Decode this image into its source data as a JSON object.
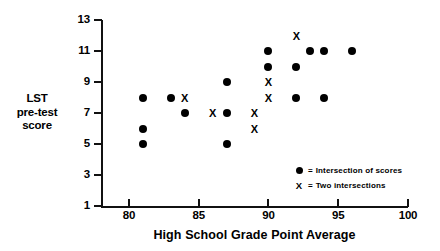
{
  "chart_data": {
    "type": "scatter",
    "title": "",
    "xlabel": "High School Grade Point Average",
    "ylabel": "LST pre-test score",
    "ylabel_lines": [
      "LST",
      "pre-test",
      "score"
    ],
    "xlim": [
      78,
      100
    ],
    "ylim": [
      1,
      13
    ],
    "xticks": [
      80,
      85,
      90,
      95,
      100
    ],
    "xtick_labels": [
      "80",
      "85",
      "90",
      "95",
      "100"
    ],
    "yticks": [
      1,
      3,
      5,
      7,
      9,
      11,
      13
    ],
    "ytick_labels": [
      "1",
      "3",
      "5",
      "7",
      "9",
      "11",
      "13"
    ],
    "grid": false,
    "legend_position": "inside-bottom-right",
    "series": [
      {
        "name": "Intersection of scores",
        "marker": "dot",
        "points": [
          {
            "x": 81,
            "y": 8
          },
          {
            "x": 81,
            "y": 6
          },
          {
            "x": 81,
            "y": 5
          },
          {
            "x": 83,
            "y": 8
          },
          {
            "x": 84,
            "y": 7
          },
          {
            "x": 87,
            "y": 9
          },
          {
            "x": 87,
            "y": 7
          },
          {
            "x": 87,
            "y": 5
          },
          {
            "x": 90,
            "y": 11
          },
          {
            "x": 90,
            "y": 10
          },
          {
            "x": 92,
            "y": 10
          },
          {
            "x": 92,
            "y": 8
          },
          {
            "x": 93,
            "y": 11
          },
          {
            "x": 94,
            "y": 11
          },
          {
            "x": 94,
            "y": 8
          },
          {
            "x": 96,
            "y": 11
          }
        ]
      },
      {
        "name": "Two intersections",
        "marker": "x",
        "points": [
          {
            "x": 84,
            "y": 8
          },
          {
            "x": 86,
            "y": 7
          },
          {
            "x": 89,
            "y": 7
          },
          {
            "x": 89,
            "y": 6
          },
          {
            "x": 90,
            "y": 9
          },
          {
            "x": 90,
            "y": 8
          },
          {
            "x": 92,
            "y": 12
          }
        ]
      }
    ]
  },
  "legend": {
    "items": [
      {
        "symbol": "dot",
        "equals": "=",
        "label": "Intersection of scores"
      },
      {
        "symbol": "x",
        "equals": "=",
        "label": "Two  intersections"
      }
    ]
  },
  "colors": {
    "marker": "#000000",
    "axis": "#111111",
    "background": "#ffffff"
  }
}
